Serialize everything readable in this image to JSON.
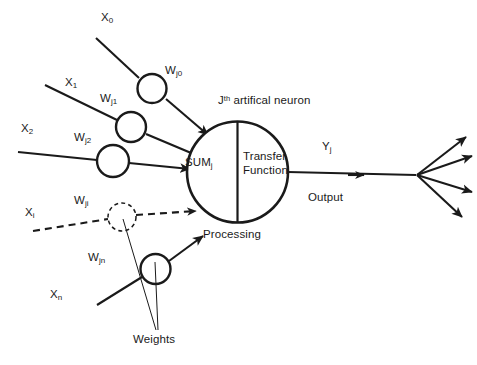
{
  "diagram": {
    "background_color": "#ffffff",
    "stroke_color": "#1a1a1a",
    "inputs": [
      {
        "label": "X",
        "subscript": "0"
      },
      {
        "label": "X",
        "subscript": "1"
      },
      {
        "label": "X",
        "subscript": "2"
      },
      {
        "label": "X",
        "subscript": "i"
      },
      {
        "label": "X",
        "subscript": "n"
      }
    ],
    "weights": [
      {
        "label": "W",
        "subscript": "j0"
      },
      {
        "label": "W",
        "subscript": "j1"
      },
      {
        "label": "W",
        "subscript": "j2"
      },
      {
        "label": "W",
        "subscript": "ji"
      },
      {
        "label": "W",
        "subscript": "jn"
      }
    ],
    "weights_callout": "Weights",
    "neuron": {
      "title_prefix": "J",
      "title_superscript": "th",
      "title_suffix": " artifical neuron",
      "sum_label": "SUM",
      "sum_subscript": "j",
      "transfer_label": "Transfer\nFunction",
      "processing_label": "Processing"
    },
    "output": {
      "label": "Y",
      "subscript": "j",
      "caption": "Output",
      "fanout_count": 4
    }
  }
}
